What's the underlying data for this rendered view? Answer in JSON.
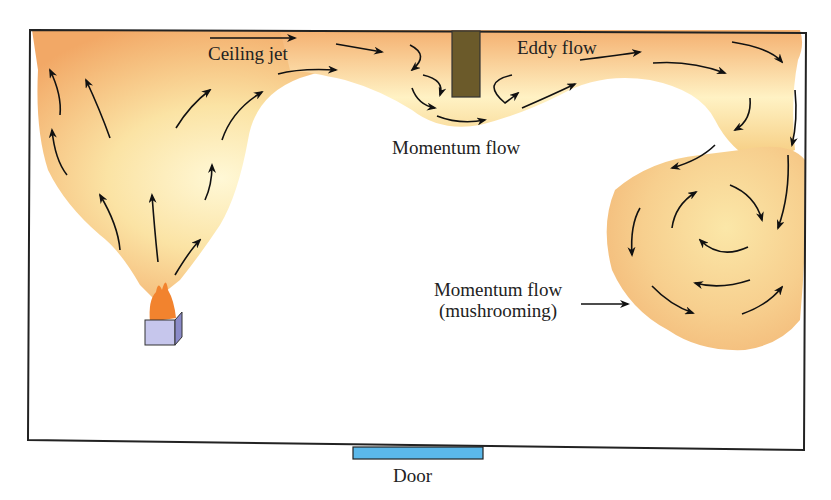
{
  "diagram": {
    "colors": {
      "smoke_outer": "#f2a866",
      "smoke_mid": "#f6c27c",
      "smoke_core": "#fff6cf",
      "mushroom": "#f7c98a",
      "obstruction": "#6b5a2a",
      "fuel_box_front": "#c6c6ec",
      "fuel_box_side": "#8a8ac8",
      "flame": "#f2832e",
      "door": "#5bb8ea",
      "wall": "#222222",
      "arrow": "#111111"
    },
    "labels": {
      "ceiling_jet": "Ceiling jet",
      "eddy_flow": "Eddy flow",
      "momentum_flow": "Momentum flow",
      "momentum_mushroom_line1": "Momentum flow",
      "momentum_mushroom_line2": "(mushrooming)",
      "door": "Door"
    },
    "elements": [
      {
        "id": "room",
        "type": "rectangle"
      },
      {
        "id": "fire-source",
        "type": "fuel box with flame"
      },
      {
        "id": "plume",
        "type": "smoke plume"
      },
      {
        "id": "ceiling-jet",
        "type": "smoke layer"
      },
      {
        "id": "obstruction",
        "type": "soffit / beam"
      },
      {
        "id": "mushroom-cloud",
        "type": "smoke vortex"
      },
      {
        "id": "door",
        "type": "opening"
      }
    ]
  }
}
